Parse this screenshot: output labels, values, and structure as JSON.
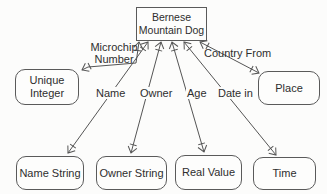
{
  "colors": {
    "background": "#fcfcfb",
    "stroke": "#555555",
    "text": "#2e2e2e",
    "node_fill": "#fdfdfc"
  },
  "diagram": {
    "type": "semantic-network",
    "central_node": {
      "line1": "Bernese",
      "line2": "Mountain Dog"
    },
    "nodes": {
      "unique_integer": {
        "line1": "Unique",
        "line2": "Integer"
      },
      "place": {
        "label": "Place"
      },
      "name_string": {
        "label": "Name String"
      },
      "owner_string": {
        "label": "Owner String"
      },
      "real_value": {
        "label": "Real Value"
      },
      "time": {
        "label": "Time"
      }
    },
    "edges": {
      "microchip_number": {
        "line1": "Microchip",
        "line2": "Number",
        "from": "Bernese Mountain Dog",
        "to": "Unique Integer"
      },
      "name": {
        "label": "Name",
        "from": "Bernese Mountain Dog",
        "to": "Name String"
      },
      "owner": {
        "label": "Owner",
        "from": "Bernese Mountain Dog",
        "to": "Owner String"
      },
      "age": {
        "label": "Age",
        "from": "Bernese Mountain Dog",
        "to": "Real Value"
      },
      "date_in": {
        "label": "Date in",
        "from": "Bernese Mountain Dog",
        "to": "Time"
      },
      "country_from": {
        "label": "Country From",
        "from": "Bernese Mountain Dog",
        "to": "Place"
      }
    }
  }
}
